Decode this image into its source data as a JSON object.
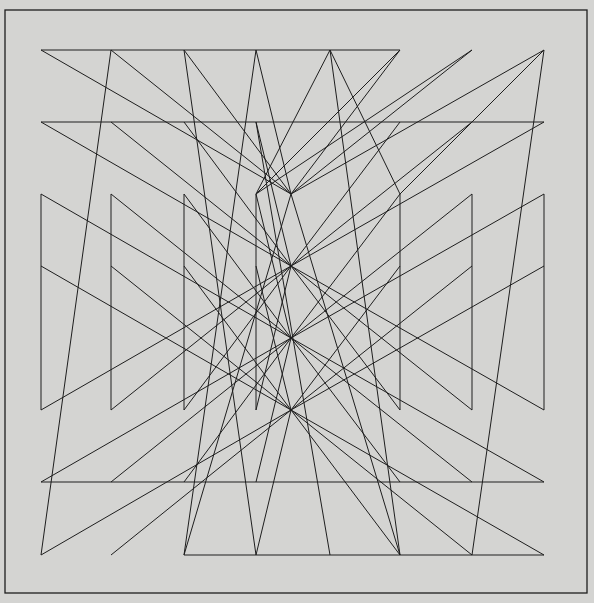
{
  "artwork": {
    "background": "#d4d4d2",
    "stroke": "#1e1e1e",
    "frame": {
      "x1": 5,
      "y1": 10,
      "x2": 587,
      "y2": 593
    },
    "segments": [
      [
        41,
        50,
        400,
        50
      ],
      [
        41,
        122,
        544,
        122
      ],
      [
        41,
        482,
        544,
        482
      ],
      [
        184,
        555,
        544,
        555
      ],
      [
        41,
        194,
        41,
        410
      ],
      [
        111,
        194,
        111,
        410
      ],
      [
        184,
        194,
        184,
        410
      ],
      [
        256,
        194,
        256,
        410
      ],
      [
        400,
        194,
        400,
        410
      ],
      [
        472,
        194,
        472,
        410
      ],
      [
        544,
        194,
        544,
        410
      ],
      [
        41,
        50,
        291,
        194
      ],
      [
        111,
        50,
        291,
        194
      ],
      [
        184,
        50,
        291,
        194
      ],
      [
        256,
        50,
        291,
        194
      ],
      [
        400,
        50,
        291,
        194
      ],
      [
        472,
        50,
        291,
        194
      ],
      [
        544,
        50,
        291,
        194
      ],
      [
        41,
        122,
        291,
        266
      ],
      [
        111,
        122,
        291,
        266
      ],
      [
        184,
        122,
        291,
        266
      ],
      [
        256,
        122,
        291,
        266
      ],
      [
        400,
        122,
        291,
        266
      ],
      [
        472,
        122,
        291,
        266
      ],
      [
        544,
        122,
        291,
        266
      ],
      [
        41,
        194,
        291,
        338
      ],
      [
        111,
        194,
        291,
        338
      ],
      [
        184,
        194,
        291,
        338
      ],
      [
        256,
        194,
        291,
        338
      ],
      [
        400,
        194,
        291,
        338
      ],
      [
        472,
        194,
        291,
        338
      ],
      [
        544,
        194,
        291,
        338
      ],
      [
        41,
        266,
        291,
        410
      ],
      [
        111,
        266,
        291,
        410
      ],
      [
        184,
        266,
        291,
        410
      ],
      [
        256,
        266,
        291,
        410
      ],
      [
        400,
        266,
        291,
        410
      ],
      [
        472,
        266,
        291,
        410
      ],
      [
        544,
        266,
        291,
        410
      ],
      [
        41,
        410,
        291,
        266
      ],
      [
        111,
        410,
        291,
        266
      ],
      [
        184,
        410,
        291,
        266
      ],
      [
        256,
        410,
        291,
        266
      ],
      [
        400,
        410,
        291,
        266
      ],
      [
        472,
        410,
        291,
        266
      ],
      [
        544,
        410,
        291,
        266
      ],
      [
        41,
        482,
        291,
        338
      ],
      [
        111,
        482,
        291,
        338
      ],
      [
        184,
        482,
        291,
        338
      ],
      [
        256,
        482,
        291,
        338
      ],
      [
        400,
        482,
        291,
        338
      ],
      [
        472,
        482,
        291,
        338
      ],
      [
        544,
        482,
        291,
        338
      ],
      [
        41,
        555,
        291,
        410
      ],
      [
        111,
        555,
        291,
        410
      ],
      [
        256,
        555,
        291,
        410
      ],
      [
        400,
        555,
        291,
        410
      ],
      [
        472,
        555,
        291,
        410
      ],
      [
        544,
        555,
        291,
        410
      ],
      [
        184,
        555,
        291,
        194
      ],
      [
        400,
        555,
        291,
        194
      ],
      [
        111,
        50,
        41,
        555
      ],
      [
        256,
        50,
        184,
        555
      ],
      [
        544,
        50,
        472,
        555
      ],
      [
        184,
        50,
        256,
        555
      ],
      [
        330,
        50,
        400,
        555
      ],
      [
        256,
        122,
        330,
        555
      ],
      [
        400,
        50,
        256,
        194
      ],
      [
        472,
        50,
        256,
        194
      ],
      [
        544,
        50,
        400,
        194
      ],
      [
        330,
        50,
        256,
        194
      ],
      [
        330,
        50,
        400,
        194
      ]
    ]
  }
}
